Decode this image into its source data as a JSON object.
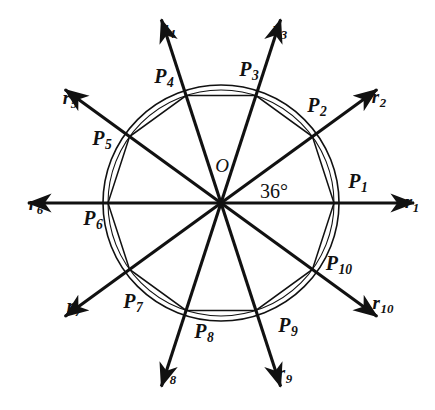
{
  "figure": {
    "center_label": "O",
    "angle_label": "36°",
    "stroke_color": "#111111",
    "background_color": "#ffffff",
    "geometry": {
      "center_x": 221,
      "center_y": 203,
      "circle_radius": 118,
      "inner_circle_radius": 113,
      "ray_length": 193,
      "vertex_count": 10,
      "angle_step_degrees": 36,
      "start_angle_degrees": 0
    },
    "vertices": [
      {
        "id": "P1",
        "label": "P",
        "sub": "1",
        "angle": 0,
        "label_x": 358,
        "label_y": 183
      },
      {
        "id": "P2",
        "label": "P",
        "sub": "2",
        "angle": 36,
        "label_x": 317,
        "label_y": 107
      },
      {
        "id": "P3",
        "label": "P",
        "sub": "3",
        "angle": 72,
        "label_x": 249,
        "label_y": 71
      },
      {
        "id": "P4",
        "label": "P",
        "sub": "4",
        "angle": 108,
        "label_x": 164,
        "label_y": 78
      },
      {
        "id": "P5",
        "label": "P",
        "sub": "5",
        "angle": 144,
        "label_x": 102,
        "label_y": 140
      },
      {
        "id": "P6",
        "label": "P",
        "sub": "6",
        "angle": 180,
        "label_x": 93,
        "label_y": 220
      },
      {
        "id": "P7",
        "label": "P",
        "sub": "7",
        "angle": 216,
        "label_x": 133,
        "label_y": 303
      },
      {
        "id": "P8",
        "label": "P",
        "sub": "8",
        "angle": 252,
        "label_x": 204,
        "label_y": 333
      },
      {
        "id": "P9",
        "label": "P",
        "sub": "9",
        "angle": 288,
        "label_x": 288,
        "label_y": 327
      },
      {
        "id": "P10",
        "label": "P",
        "sub": "10",
        "angle": 324,
        "label_x": 339,
        "label_y": 265
      }
    ],
    "rays": [
      {
        "id": "r1",
        "label": "r",
        "sub": "1",
        "angle": 0,
        "label_x": 412,
        "label_y": 203
      },
      {
        "id": "r2",
        "label": "r",
        "sub": "2",
        "angle": 36,
        "label_x": 379,
        "label_y": 98
      },
      {
        "id": "r3",
        "label": "r",
        "sub": "3",
        "angle": 72,
        "label_x": 280,
        "label_y": 30
      },
      {
        "id": "r4",
        "label": "r",
        "sub": "4",
        "angle": 108,
        "label_x": 168,
        "label_y": 29
      },
      {
        "id": "r5",
        "label": "r",
        "sub": "5",
        "angle": 144,
        "label_x": 70,
        "label_y": 99
      },
      {
        "id": "r6",
        "label": "r",
        "sub": "6",
        "angle": 180,
        "label_x": 36,
        "label_y": 205
      },
      {
        "id": "r7",
        "label": "r",
        "sub": "7",
        "angle": 216,
        "label_x": 74,
        "label_y": 307
      },
      {
        "id": "r8",
        "label": "r",
        "sub": "8",
        "angle": 252,
        "label_x": 169,
        "label_y": 375
      },
      {
        "id": "r9",
        "label": "r",
        "sub": "9",
        "angle": 288,
        "label_x": 285,
        "label_y": 374
      },
      {
        "id": "r10",
        "label": "r",
        "sub": "10",
        "angle": 324,
        "label_x": 383,
        "label_y": 304
      }
    ],
    "center_label_pos": {
      "x": 222,
      "y": 165
    },
    "angle_label_pos": {
      "x": 274,
      "y": 191
    }
  }
}
